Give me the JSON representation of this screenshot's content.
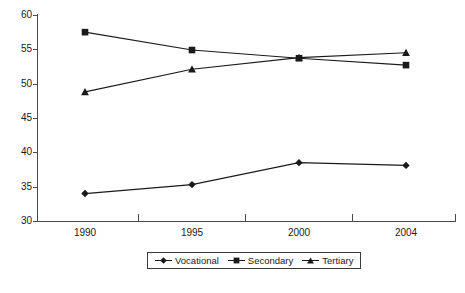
{
  "chart_data": {
    "type": "line",
    "title": "",
    "subtitle": "",
    "xlabel": "",
    "ylabel": "",
    "categories": [
      "1990",
      "1995",
      "2000",
      "2004"
    ],
    "x": [
      1990,
      1995,
      2000,
      2004
    ],
    "series": [
      {
        "name": "Vocational",
        "marker": "diamond",
        "color": "#1a1a1a",
        "values": [
          34.0,
          35.3,
          38.5,
          38.1
        ]
      },
      {
        "name": "Secondary",
        "marker": "square",
        "color": "#1a1a1a",
        "values": [
          57.5,
          54.9,
          53.7,
          52.7
        ]
      },
      {
        "name": "Tertiary",
        "marker": "triangle",
        "color": "#1a1a1a",
        "values": [
          48.8,
          52.1,
          53.8,
          54.5
        ]
      }
    ],
    "ylim": [
      30,
      60
    ],
    "yticks": [
      30,
      35,
      40,
      45,
      50,
      55,
      60
    ],
    "ytick_labels": [
      "30",
      "35",
      "40",
      "45",
      "50",
      "55",
      "60"
    ],
    "xtick_labels": [
      "1990",
      "1995",
      "2000",
      "2004"
    ],
    "grid": false,
    "legend_position": "bottom-center",
    "legend_entries": [
      "Vocational",
      "Secondary",
      "Tertiary"
    ],
    "annotations": []
  },
  "footnote": {
    "text": ""
  },
  "colors": {
    "axis": "#4a4a4a",
    "ink": "#1a1a1a",
    "background": "#ffffff"
  }
}
